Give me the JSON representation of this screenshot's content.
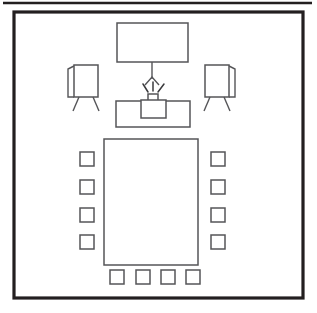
{
  "diagram": {
    "view": "top-down floor plan",
    "canvas": {
      "width": 317,
      "height": 313
    },
    "colors": {
      "wall_stroke": "#231f20",
      "furniture_stroke": "#555558",
      "fill": "#ffffff",
      "background": "#ffffff"
    },
    "top_rule": {
      "label": "page-divider-rule",
      "x1": 3,
      "y1": 3,
      "x2": 312,
      "y2": 3
    },
    "room": {
      "label": "Room Boundary",
      "x": 14,
      "y": 12,
      "width": 289,
      "height": 286
    },
    "items": [
      {
        "id": "projection-screen",
        "label": "Projection Screen",
        "shape": "rect",
        "x": 117,
        "y": 23,
        "width": 71,
        "height": 39
      },
      {
        "id": "screen-drop-line",
        "label": "Screen Pull-Down Cord",
        "shape": "line",
        "x1": 152,
        "y1": 62,
        "x2": 152,
        "y2": 79
      },
      {
        "id": "screen-drop-handle",
        "label": "Screen Pull-Down Handle",
        "shape": "polyline",
        "points": "145,85 152,77 159,85"
      },
      {
        "id": "flipchart-easel-left",
        "label": "Flipchart Easel (Left)",
        "board": {
          "x": 74,
          "y": 65,
          "width": 24,
          "height": 32
        },
        "flap": "74,66 68,69 68,97 74,97",
        "legs": [
          {
            "x1": 79,
            "y1": 97,
            "x2": 73,
            "y2": 111
          },
          {
            "x1": 93,
            "y1": 97,
            "x2": 99,
            "y2": 111
          }
        ]
      },
      {
        "id": "flipchart-easel-right",
        "label": "Flipchart Easel (Right)",
        "board": {
          "x": 205,
          "y": 65,
          "width": 24,
          "height": 32
        },
        "flap": "229,66 235,69 235,97 229,97",
        "legs": [
          {
            "x1": 210,
            "y1": 97,
            "x2": 204,
            "y2": 111
          },
          {
            "x1": 224,
            "y1": 97,
            "x2": 230,
            "y2": 111
          }
        ]
      },
      {
        "id": "presenter-table",
        "label": "Presenter Table",
        "shape": "rect",
        "x": 116,
        "y": 101,
        "width": 74,
        "height": 26
      },
      {
        "id": "projector-body",
        "label": "Projector",
        "shape": "rect",
        "x": 141,
        "y": 100,
        "width": 25,
        "height": 18
      },
      {
        "id": "projector-lens",
        "label": "Projector Lens",
        "shape": "rect",
        "x": 148,
        "y": 94,
        "width": 10,
        "height": 7
      },
      {
        "id": "projector-light-rays",
        "label": "Projector Light Beams",
        "rays": [
          {
            "x1": 143,
            "y1": 84,
            "x2": 148,
            "y2": 92
          },
          {
            "x1": 153,
            "y1": 82,
            "x2": 153,
            "y2": 91
          },
          {
            "x1": 164,
            "y1": 84,
            "x2": 158,
            "y2": 92
          }
        ]
      },
      {
        "id": "conference-table",
        "label": "Conference Table",
        "shape": "rect",
        "x": 104,
        "y": 139,
        "width": 94,
        "height": 126
      }
    ],
    "chairs": {
      "label": "Chairs",
      "size": 14,
      "total": 12,
      "left_side": [
        {
          "id": "chair-left-1",
          "x": 80,
          "y": 152
        },
        {
          "id": "chair-left-2",
          "x": 80,
          "y": 180
        },
        {
          "id": "chair-left-3",
          "x": 80,
          "y": 208
        },
        {
          "id": "chair-left-4",
          "x": 80,
          "y": 235
        }
      ],
      "right_side": [
        {
          "id": "chair-right-1",
          "x": 211,
          "y": 152
        },
        {
          "id": "chair-right-2",
          "x": 211,
          "y": 180
        },
        {
          "id": "chair-right-3",
          "x": 211,
          "y": 208
        },
        {
          "id": "chair-right-4",
          "x": 211,
          "y": 235
        }
      ],
      "bottom_side": [
        {
          "id": "chair-bottom-1",
          "x": 110,
          "y": 270
        },
        {
          "id": "chair-bottom-2",
          "x": 136,
          "y": 270
        },
        {
          "id": "chair-bottom-3",
          "x": 161,
          "y": 270
        },
        {
          "id": "chair-bottom-4",
          "x": 186,
          "y": 270
        }
      ]
    }
  }
}
